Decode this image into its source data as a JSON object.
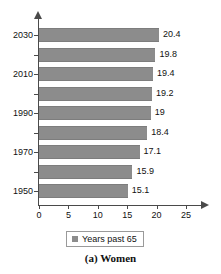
{
  "chart_data": {
    "type": "bar",
    "orientation": "horizontal",
    "title": "",
    "caption": "(a) Women",
    "xlabel": "",
    "ylabel": "",
    "xlim": [
      0,
      25
    ],
    "xticks": [
      0,
      5,
      10,
      15,
      20,
      25
    ],
    "xtick_labels": [
      "0",
      "5",
      "10",
      "15",
      "20",
      "25"
    ],
    "grid": false,
    "legend": {
      "position": "bottom",
      "entries": [
        {
          "label": "Years past 65",
          "color": "#8c8c8c"
        }
      ]
    },
    "categories": [
      "1950",
      "1960",
      "1970",
      "1980",
      "1990",
      "2000",
      "2010",
      "2020",
      "2030"
    ],
    "ytick_labels": [
      "1950",
      "",
      "1970",
      "",
      "1990",
      "",
      "2010",
      "",
      "2030"
    ],
    "series": [
      {
        "name": "Years past 65",
        "color": "#8c8c8c",
        "values": [
          15.1,
          15.9,
          17.1,
          18.4,
          19,
          19.2,
          19.4,
          19.8,
          20.4
        ],
        "data_labels": [
          "15.1",
          "15.9",
          "17.1",
          "18.4",
          "19",
          "19.2",
          "19.4",
          "19.8",
          "20.4"
        ]
      }
    ],
    "bars_top_to_bottom": [
      {
        "category": "2030",
        "value": 20.4,
        "label": "20.4",
        "axis_label": "2030"
      },
      {
        "category": "2020",
        "value": 19.8,
        "label": "19.8",
        "axis_label": ""
      },
      {
        "category": "2010",
        "value": 19.4,
        "label": "19.4",
        "axis_label": "2010"
      },
      {
        "category": "2000",
        "value": 19.2,
        "label": "19.2",
        "axis_label": ""
      },
      {
        "category": "1990",
        "value": 19,
        "label": "19",
        "axis_label": "1990"
      },
      {
        "category": "1980",
        "value": 18.4,
        "label": "18.4",
        "axis_label": ""
      },
      {
        "category": "1970",
        "value": 17.1,
        "label": "17.1",
        "axis_label": "1970"
      },
      {
        "category": "1960",
        "value": 15.9,
        "label": "15.9",
        "axis_label": ""
      },
      {
        "category": "1950",
        "value": 15.1,
        "label": "15.1",
        "axis_label": "1950"
      }
    ],
    "colors": {
      "bar": "#8c8c8c",
      "axis": "#4a4a4a",
      "text": "#111111",
      "background": "#ffffff"
    }
  }
}
